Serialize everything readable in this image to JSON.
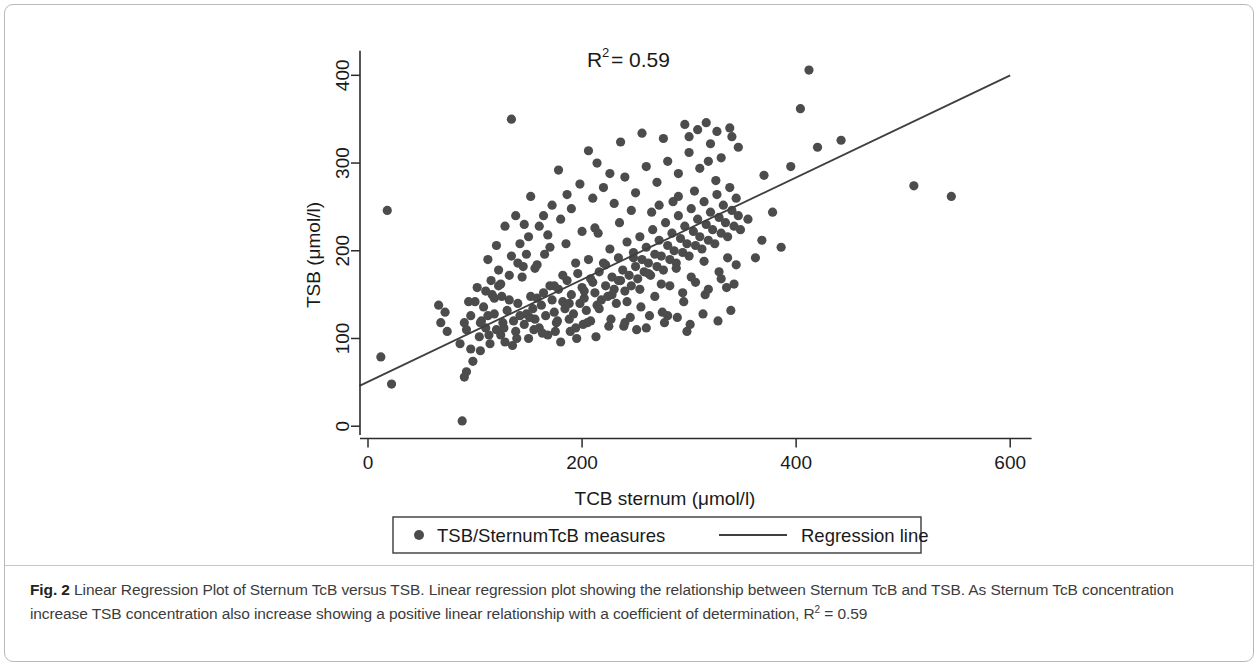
{
  "figure": {
    "label": "Fig. 2",
    "caption_text": " Linear Regression Plot of Sternum TcB versus TSB. Linear regression plot showing the relationship between Sternum TcB and TSB. As Sternum TcB concentration increase TSB concentration also increase showing a positive linear relationship with a coefficient of determination, R",
    "caption_sup": "2",
    "caption_tail": " = 0.59"
  },
  "annotation": {
    "r_squared_symbol": "R",
    "r_squared_exp": "2",
    "r_squared_value": " = 0.59"
  },
  "legend": {
    "marker_label": "TSB/SternumTcB  measures",
    "line_label": "Regression line"
  },
  "colors": {
    "point": "#4c4c4c",
    "line": "#3f3f3f",
    "axis": "#2b2b2b",
    "frame": "#b9b9b9",
    "caption": "#3c3c3c"
  },
  "chart_data": {
    "type": "scatter",
    "title": "",
    "xlabel": "TCB sternum (μmol/l)",
    "ylabel": "TSB (μmol/l)",
    "xlim": [
      0,
      640
    ],
    "ylim": [
      -18,
      430
    ],
    "xticks": [
      0,
      200,
      400,
      600
    ],
    "yticks": [
      0,
      100,
      200,
      300,
      400
    ],
    "xticklabels": [
      "0",
      "200",
      "400",
      "600"
    ],
    "yticklabels": [
      "0",
      "100",
      "200",
      "300",
      "400"
    ],
    "grid": false,
    "legend_position": "below-axes",
    "annotations": [
      {
        "text": "R2 = 0.59",
        "x": 245,
        "y": 412
      }
    ],
    "series": [
      {
        "name": "TSB/SternumTcB  measures",
        "type": "scatter",
        "marker": "circle",
        "color": "#4c4c4c",
        "points": [
          [
            12,
            79
          ],
          [
            22,
            48
          ],
          [
            18,
            246
          ],
          [
            68,
            118
          ],
          [
            72,
            130
          ],
          [
            66,
            138
          ],
          [
            74,
            108
          ],
          [
            88,
            6
          ],
          [
            90,
            56
          ],
          [
            92,
            62
          ],
          [
            96,
            88
          ],
          [
            98,
            74
          ],
          [
            104,
            102
          ],
          [
            106,
            120
          ],
          [
            108,
            136
          ],
          [
            110,
            112
          ],
          [
            112,
            126
          ],
          [
            114,
            94
          ],
          [
            116,
            150
          ],
          [
            118,
            128
          ],
          [
            120,
            110
          ],
          [
            122,
            160
          ],
          [
            124,
            104
          ],
          [
            126,
            118
          ],
          [
            128,
            96
          ],
          [
            130,
            132
          ],
          [
            132,
            144
          ],
          [
            134,
            350
          ],
          [
            136,
            120
          ],
          [
            138,
            108
          ],
          [
            140,
            140
          ],
          [
            142,
            126
          ],
          [
            144,
            170
          ],
          [
            146,
            116
          ],
          [
            148,
            128
          ],
          [
            150,
            100
          ],
          [
            152,
            148
          ],
          [
            154,
            134
          ],
          [
            156,
            122
          ],
          [
            158,
            184
          ],
          [
            160,
            112
          ],
          [
            162,
            138
          ],
          [
            164,
            152
          ],
          [
            166,
            126
          ],
          [
            168,
            104
          ],
          [
            170,
            160
          ],
          [
            172,
            144
          ],
          [
            174,
            130
          ],
          [
            176,
            118
          ],
          [
            178,
            156
          ],
          [
            180,
            96
          ],
          [
            182,
            142
          ],
          [
            184,
            134
          ],
          [
            186,
            166
          ],
          [
            188,
            122
          ],
          [
            190,
            150
          ],
          [
            192,
            128
          ],
          [
            194,
            112
          ],
          [
            196,
            174
          ],
          [
            198,
            140
          ],
          [
            200,
            158
          ],
          [
            202,
            146
          ],
          [
            204,
            132
          ],
          [
            206,
            190
          ],
          [
            208,
            120
          ],
          [
            210,
            164
          ],
          [
            212,
            152
          ],
          [
            214,
            138
          ],
          [
            216,
            176
          ],
          [
            218,
            144
          ],
          [
            220,
            186
          ],
          [
            222,
            160
          ],
          [
            224,
            148
          ],
          [
            226,
            202
          ],
          [
            228,
            170
          ],
          [
            230,
            156
          ],
          [
            232,
            140
          ],
          [
            234,
            192
          ],
          [
            236,
            166
          ],
          [
            238,
            178
          ],
          [
            240,
            154
          ],
          [
            242,
            210
          ],
          [
            244,
            172
          ],
          [
            246,
            160
          ],
          [
            248,
            198
          ],
          [
            250,
            182
          ],
          [
            252,
            168
          ],
          [
            254,
            216
          ],
          [
            256,
            190
          ],
          [
            258,
            176
          ],
          [
            260,
            204
          ],
          [
            262,
            186
          ],
          [
            264,
            172
          ],
          [
            266,
            224
          ],
          [
            268,
            196
          ],
          [
            270,
            182
          ],
          [
            272,
            212
          ],
          [
            274,
            194
          ],
          [
            276,
            178
          ],
          [
            278,
            232
          ],
          [
            280,
            206
          ],
          [
            282,
            190
          ],
          [
            284,
            220
          ],
          [
            286,
            200
          ],
          [
            288,
            186
          ],
          [
            290,
            240
          ],
          [
            292,
            214
          ],
          [
            294,
            198
          ],
          [
            296,
            228
          ],
          [
            298,
            208
          ],
          [
            300,
            194
          ],
          [
            302,
            248
          ],
          [
            304,
            222
          ],
          [
            306,
            206
          ],
          [
            308,
            236
          ],
          [
            310,
            216
          ],
          [
            312,
            202
          ],
          [
            314,
            256
          ],
          [
            316,
            230
          ],
          [
            318,
            212
          ],
          [
            320,
            244
          ],
          [
            322,
            224
          ],
          [
            324,
            208
          ],
          [
            326,
            264
          ],
          [
            328,
            238
          ],
          [
            330,
            220
          ],
          [
            332,
            252
          ],
          [
            334,
            232
          ],
          [
            336,
            216
          ],
          [
            338,
            272
          ],
          [
            340,
            246
          ],
          [
            342,
            228
          ],
          [
            344,
            260
          ],
          [
            346,
            240
          ],
          [
            348,
            224
          ],
          [
            105,
            86
          ],
          [
            115,
            166
          ],
          [
            125,
            148
          ],
          [
            135,
            92
          ],
          [
            145,
            182
          ],
          [
            155,
            110
          ],
          [
            165,
            196
          ],
          [
            175,
            108
          ],
          [
            185,
            208
          ],
          [
            195,
            100
          ],
          [
            205,
            118
          ],
          [
            215,
            220
          ],
          [
            225,
            114
          ],
          [
            235,
            232
          ],
          [
            245,
            124
          ],
          [
            255,
            136
          ],
          [
            265,
            244
          ],
          [
            275,
            130
          ],
          [
            285,
            256
          ],
          [
            295,
            142
          ],
          [
            305,
            268
          ],
          [
            315,
            150
          ],
          [
            325,
            280
          ],
          [
            335,
            158
          ],
          [
            150,
            216
          ],
          [
            160,
            228
          ],
          [
            170,
            204
          ],
          [
            180,
            236
          ],
          [
            190,
            248
          ],
          [
            200,
            222
          ],
          [
            210,
            260
          ],
          [
            220,
            272
          ],
          [
            230,
            254
          ],
          [
            240,
            284
          ],
          [
            250,
            266
          ],
          [
            260,
            296
          ],
          [
            270,
            278
          ],
          [
            280,
            302
          ],
          [
            290,
            288
          ],
          [
            300,
            312
          ],
          [
            310,
            294
          ],
          [
            320,
            322
          ],
          [
            330,
            306
          ],
          [
            340,
            330
          ],
          [
            346,
            318
          ],
          [
            338,
            340
          ],
          [
            326,
            336
          ],
          [
            318,
            302
          ],
          [
            214,
            300
          ],
          [
            226,
            288
          ],
          [
            198,
            276
          ],
          [
            186,
            264
          ],
          [
            172,
            252
          ],
          [
            164,
            240
          ],
          [
            148,
            196
          ],
          [
            140,
            186
          ],
          [
            132,
            172
          ],
          [
            124,
            162
          ],
          [
            118,
            146
          ],
          [
            110,
            154
          ],
          [
            100,
            142
          ],
          [
            96,
            126
          ],
          [
            92,
            110
          ],
          [
            86,
            94
          ],
          [
            128,
            228
          ],
          [
            138,
            240
          ],
          [
            152,
            262
          ],
          [
            178,
            292
          ],
          [
            206,
            314
          ],
          [
            236,
            324
          ],
          [
            256,
            334
          ],
          [
            276,
            328
          ],
          [
            296,
            344
          ],
          [
            308,
            338
          ],
          [
            316,
            346
          ],
          [
            300,
            330
          ],
          [
            112,
            190
          ],
          [
            122,
            178
          ],
          [
            142,
            208
          ],
          [
            156,
            180
          ],
          [
            168,
            218
          ],
          [
            182,
            172
          ],
          [
            194,
            186
          ],
          [
            208,
            168
          ],
          [
            222,
            184
          ],
          [
            234,
            166
          ],
          [
            248,
            192
          ],
          [
            262,
            174
          ],
          [
            274,
            162
          ],
          [
            288,
            180
          ],
          [
            302,
            170
          ],
          [
            314,
            188
          ],
          [
            328,
            176
          ],
          [
            336,
            192
          ],
          [
            344,
            184
          ],
          [
            120,
            206
          ],
          [
            134,
            194
          ],
          [
            146,
            230
          ],
          [
            158,
            146
          ],
          [
            174,
            160
          ],
          [
            188,
            140
          ],
          [
            202,
            154
          ],
          [
            216,
            134
          ],
          [
            228,
            150
          ],
          [
            242,
            142
          ],
          [
            254,
            156
          ],
          [
            268,
            148
          ],
          [
            282,
            160
          ],
          [
            294,
            152
          ],
          [
            306,
            164
          ],
          [
            318,
            156
          ],
          [
            330,
            168
          ],
          [
            342,
            162
          ],
          [
            105,
            118
          ],
          [
            113,
            104
          ],
          [
            127,
            112
          ],
          [
            139,
            100
          ],
          [
            151,
            124
          ],
          [
            163,
            106
          ],
          [
            177,
            120
          ],
          [
            189,
            108
          ],
          [
            201,
            116
          ],
          [
            213,
            102
          ],
          [
            227,
            122
          ],
          [
            239,
            114
          ],
          [
            251,
            110
          ],
          [
            263,
            126
          ],
          [
            277,
            118
          ],
          [
            289,
            124
          ],
          [
            301,
            116
          ],
          [
            313,
            128
          ],
          [
            327,
            120
          ],
          [
            339,
            132
          ],
          [
            370,
            286
          ],
          [
            378,
            244
          ],
          [
            386,
            204
          ],
          [
            395,
            296
          ],
          [
            404,
            362
          ],
          [
            412,
            406
          ],
          [
            420,
            318
          ],
          [
            442,
            326
          ],
          [
            510,
            274
          ],
          [
            545,
            262
          ],
          [
            355,
            236
          ],
          [
            362,
            192
          ],
          [
            368,
            212
          ],
          [
            90,
            118
          ],
          [
            94,
            142
          ],
          [
            102,
            158
          ],
          [
            240,
            118
          ],
          [
            260,
            112
          ],
          [
            280,
            126
          ],
          [
            298,
            108
          ],
          [
            212,
            226
          ],
          [
            246,
            246
          ],
          [
            272,
            252
          ],
          [
            290,
            262
          ]
        ]
      },
      {
        "name": "Regression line",
        "type": "line",
        "color": "#3f3f3f",
        "x": [
          -8,
          600
        ],
        "y": [
          46,
          400
        ]
      }
    ]
  }
}
